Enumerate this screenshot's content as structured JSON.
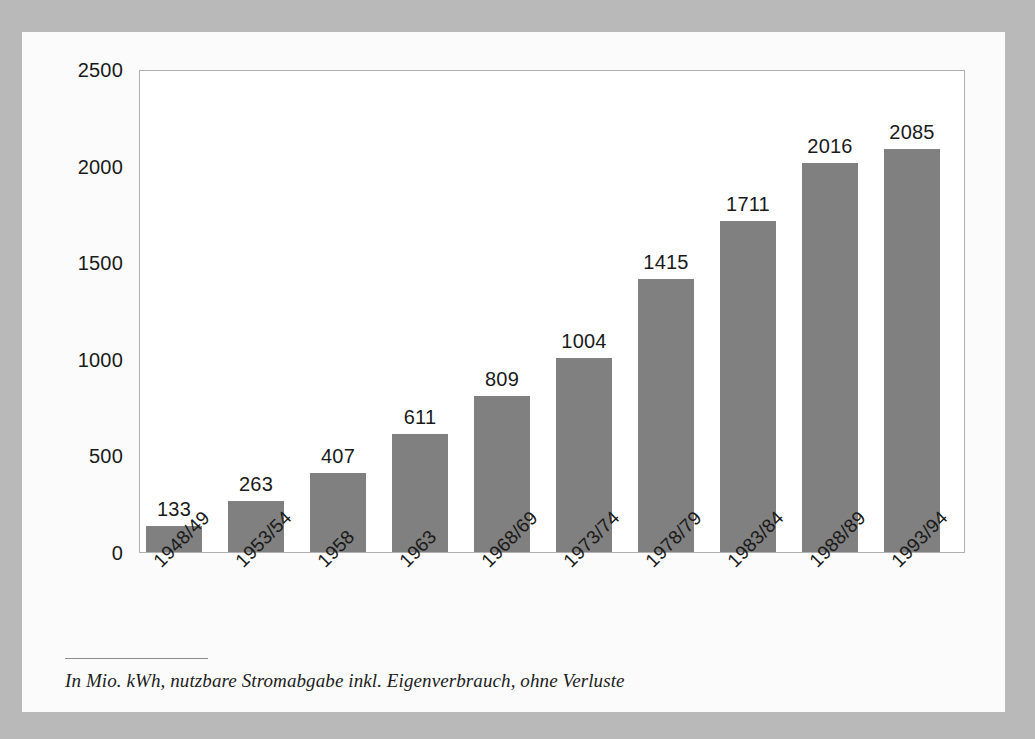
{
  "figure": {
    "footnote": "In Mio. kWh, nutzbare Stromabgabe inkl. Eigenverbrauch, ohne Verluste",
    "bar_color": "#808080",
    "panel_color": "#fbfbfb",
    "page_background": "#b9b9b9",
    "frame_color": "#b0b0b0",
    "text_color": "#1a1a1a"
  },
  "chart_data": {
    "type": "bar",
    "title": "",
    "subtitle": "",
    "xlabel": "",
    "ylabel": "",
    "categories": [
      "1948/49",
      "1953/54",
      "1958",
      "1963",
      "1968/69",
      "1973/74",
      "1978/79",
      "1983/84",
      "1988/89",
      "1993/94"
    ],
    "values": [
      133,
      263,
      407,
      611,
      809,
      1004,
      1415,
      1711,
      2016,
      2085
    ],
    "data_labels": [
      "133",
      "263",
      "407",
      "611",
      "809",
      "1004",
      "1415",
      "1711",
      "2016",
      "2085"
    ],
    "ylim": [
      0,
      2500
    ],
    "yticks": [
      0,
      500,
      1000,
      1500,
      2000,
      2500
    ],
    "ytick_labels": [
      "0",
      "500",
      "1000",
      "1500",
      "2000",
      "2500"
    ],
    "grid": false,
    "legend": false,
    "legend_position": "none",
    "annotation": "In Mio. kWh, nutzbare Stromabgabe inkl. Eigenverbrauch, ohne Verluste",
    "series_color": "#808080"
  }
}
